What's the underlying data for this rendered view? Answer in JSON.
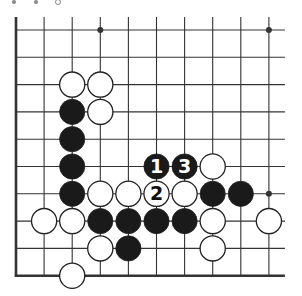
{
  "diagram": {
    "type": "go-board-fragment",
    "grid": {
      "columns": 10,
      "rows": 10,
      "origin_x": 16,
      "origin_y": 30,
      "spacing_x": 28.1,
      "spacing_y": 27.3,
      "edges": {
        "left": true,
        "bottom": true,
        "top": false,
        "right": false
      }
    },
    "star_points": [
      {
        "col": 3,
        "row": 0
      },
      {
        "col": 9,
        "row": 0
      },
      {
        "col": 9,
        "row": 6
      }
    ],
    "stones": [
      {
        "color": "white",
        "col": 2,
        "row": 2
      },
      {
        "color": "white",
        "col": 3,
        "row": 2
      },
      {
        "color": "black",
        "col": 2,
        "row": 3
      },
      {
        "color": "white",
        "col": 3,
        "row": 3
      },
      {
        "color": "black",
        "col": 2,
        "row": 4
      },
      {
        "color": "black",
        "col": 2,
        "row": 5
      },
      {
        "color": "black",
        "col": 5,
        "row": 5,
        "label": "1"
      },
      {
        "color": "black",
        "col": 6,
        "row": 5,
        "label": "3"
      },
      {
        "color": "white",
        "col": 7,
        "row": 5
      },
      {
        "color": "black",
        "col": 2,
        "row": 6
      },
      {
        "color": "white",
        "col": 3,
        "row": 6
      },
      {
        "color": "white",
        "col": 4,
        "row": 6
      },
      {
        "color": "white",
        "col": 5,
        "row": 6,
        "label": "2"
      },
      {
        "color": "white",
        "col": 6,
        "row": 6
      },
      {
        "color": "black",
        "col": 7,
        "row": 6
      },
      {
        "color": "black",
        "col": 8,
        "row": 6
      },
      {
        "color": "white",
        "col": 1,
        "row": 7
      },
      {
        "color": "white",
        "col": 2,
        "row": 7
      },
      {
        "color": "black",
        "col": 3,
        "row": 7
      },
      {
        "color": "black",
        "col": 4,
        "row": 7
      },
      {
        "color": "black",
        "col": 5,
        "row": 7
      },
      {
        "color": "black",
        "col": 6,
        "row": 7
      },
      {
        "color": "white",
        "col": 7,
        "row": 7
      },
      {
        "color": "white",
        "col": 9,
        "row": 7
      },
      {
        "color": "white",
        "col": 3,
        "row": 8
      },
      {
        "color": "black",
        "col": 4,
        "row": 8
      },
      {
        "color": "white",
        "col": 7,
        "row": 8
      },
      {
        "color": "white",
        "col": 2,
        "row": 9
      }
    ],
    "colors": {
      "line": "#333333",
      "black_stone": "#1a1a1a",
      "white_stone": "#ffffff",
      "stone_outline": "#222222"
    }
  }
}
